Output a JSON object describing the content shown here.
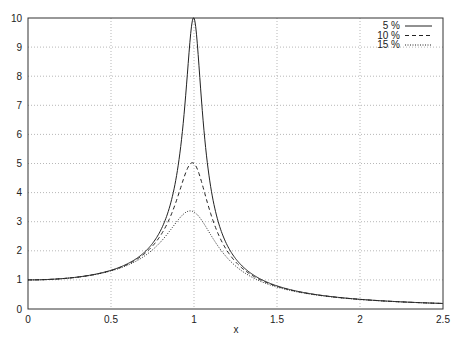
{
  "chart_data": {
    "type": "line",
    "title": "",
    "xlabel": "x",
    "ylabel": "",
    "xlim": [
      0,
      2.5
    ],
    "ylim": [
      0,
      10
    ],
    "grid": true,
    "legend_position": "top-right",
    "x_ticks": [
      "0",
      "0.5",
      "1",
      "1.5",
      "2",
      "2.5"
    ],
    "y_ticks": [
      "0",
      "1",
      "2",
      "3",
      "4",
      "5",
      "6",
      "7",
      "8",
      "9",
      "10"
    ],
    "series": [
      {
        "name": "5 %",
        "damping": 0.05,
        "style": "solid",
        "peak": 10.0
      },
      {
        "name": "10 %",
        "damping": 0.1,
        "style": "dashed",
        "peak": 5.0
      },
      {
        "name": "15 %",
        "damping": 0.15,
        "style": "dotted",
        "peak": 3.37
      }
    ],
    "x": [
      0,
      0.25,
      0.5,
      0.75,
      0.9,
      0.95,
      1.0,
      1.05,
      1.1,
      1.25,
      1.5,
      2.0,
      2.5
    ],
    "values": {
      "5 %": [
        1.0,
        1.066,
        1.33,
        2.26,
        4.9,
        7.1,
        10.0,
        7.0,
        4.6,
        1.74,
        0.79,
        0.333,
        0.19
      ],
      "10 %": [
        1.0,
        1.065,
        1.322,
        2.18,
        3.76,
        4.5,
        5.0,
        4.4,
        3.45,
        1.69,
        0.785,
        0.332,
        0.19
      ],
      "15 %": [
        1.0,
        1.064,
        1.31,
        2.07,
        2.88,
        3.2,
        3.37,
        3.14,
        2.67,
        1.61,
        0.775,
        0.331,
        0.19
      ]
    }
  }
}
